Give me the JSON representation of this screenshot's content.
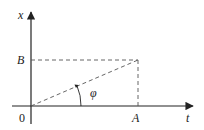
{
  "diagram": {
    "type": "phase-angle-diagram",
    "axes": {
      "x_axis_label": "t",
      "y_axis_label": "x",
      "origin_label": "0"
    },
    "points": {
      "A_label": "A",
      "B_label": "B"
    },
    "angle_label": "φ",
    "colors": {
      "line": "#222222",
      "dashed": "#555555",
      "background": "#ffffff"
    }
  }
}
